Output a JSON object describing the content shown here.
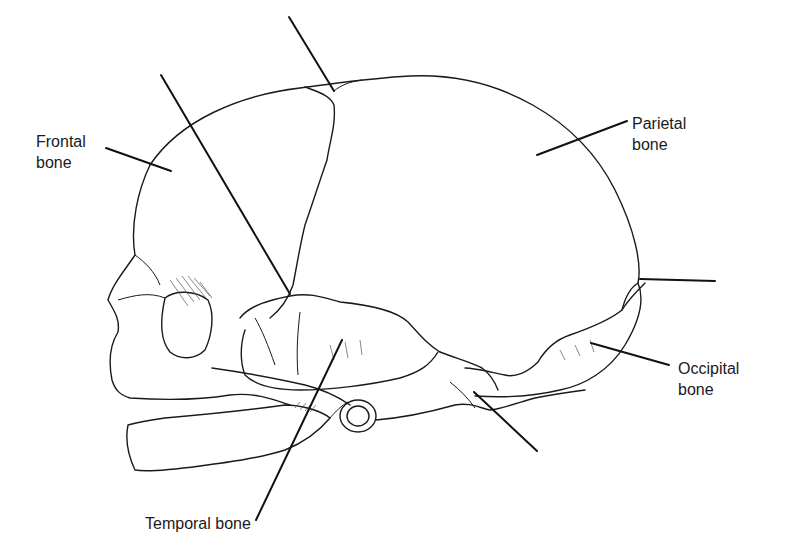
{
  "diagram": {
    "colors": {
      "ink": "#1a1a1a",
      "background": "#ffffff"
    },
    "labels": [
      {
        "id": "frontal",
        "text": "Frontal\nbone",
        "x": 36,
        "y": 131
      },
      {
        "id": "parietal",
        "text": "Parietal\nbone",
        "x": 632,
        "y": 113
      },
      {
        "id": "occipital",
        "text": "Occipital\nbone",
        "x": 678,
        "y": 358
      },
      {
        "id": "temporal",
        "text": "Temporal bone",
        "x": 145,
        "y": 513
      }
    ],
    "leader_lines": [
      {
        "id": "frontal-leader",
        "x1": 106,
        "y1": 148,
        "x2": 171,
        "y2": 171,
        "labeled": true
      },
      {
        "id": "parietal-leader",
        "x1": 627,
        "y1": 121,
        "x2": 537,
        "y2": 155,
        "labeled": true
      },
      {
        "id": "occipital-leader",
        "x1": 669,
        "y1": 365,
        "x2": 591,
        "y2": 343,
        "labeled": true
      },
      {
        "id": "temporal-leader",
        "x1": 256,
        "y1": 520,
        "x2": 342,
        "y2": 340,
        "labeled": true
      },
      {
        "id": "anterior-fontanel-leader",
        "x1": 289,
        "y1": 17,
        "x2": 334,
        "y2": 91,
        "labeled": false
      },
      {
        "id": "sphenoidal-fontanel-leader",
        "x1": 161,
        "y1": 75,
        "x2": 290,
        "y2": 294,
        "labeled": false
      },
      {
        "id": "posterior-fontanel-leader",
        "x1": 715,
        "y1": 281,
        "x2": 640,
        "y2": 279,
        "labeled": false
      },
      {
        "id": "mastoid-fontanel-leader",
        "x1": 537,
        "y1": 451,
        "x2": 474,
        "y2": 392,
        "labeled": false
      }
    ]
  }
}
